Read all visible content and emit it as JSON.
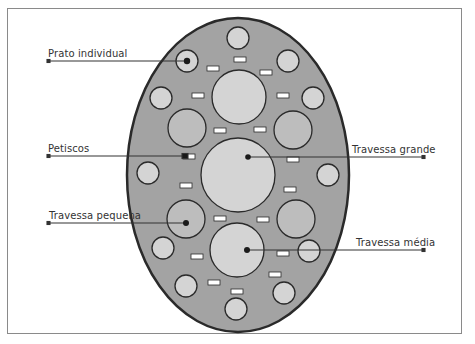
{
  "diagram": {
    "type": "table-layout-plan",
    "colors": {
      "background": "#ffffff",
      "frame": "#8a8a8a",
      "table_fill": "#a3a3a3",
      "table_stroke": "#2a2a2a",
      "dish_fill_light": "#d4d4d4",
      "dish_fill_medium": "#bdbdbd",
      "snack_fill": "#ffffff",
      "leader_line": "#333333"
    },
    "labels": {
      "prato_individual": "Prato individual",
      "petiscos": "Petiscos",
      "travessa_grande": "Travessa grande",
      "travessa_pequena": "Travessa pequena",
      "travessa_media": "Travessa média"
    }
  }
}
